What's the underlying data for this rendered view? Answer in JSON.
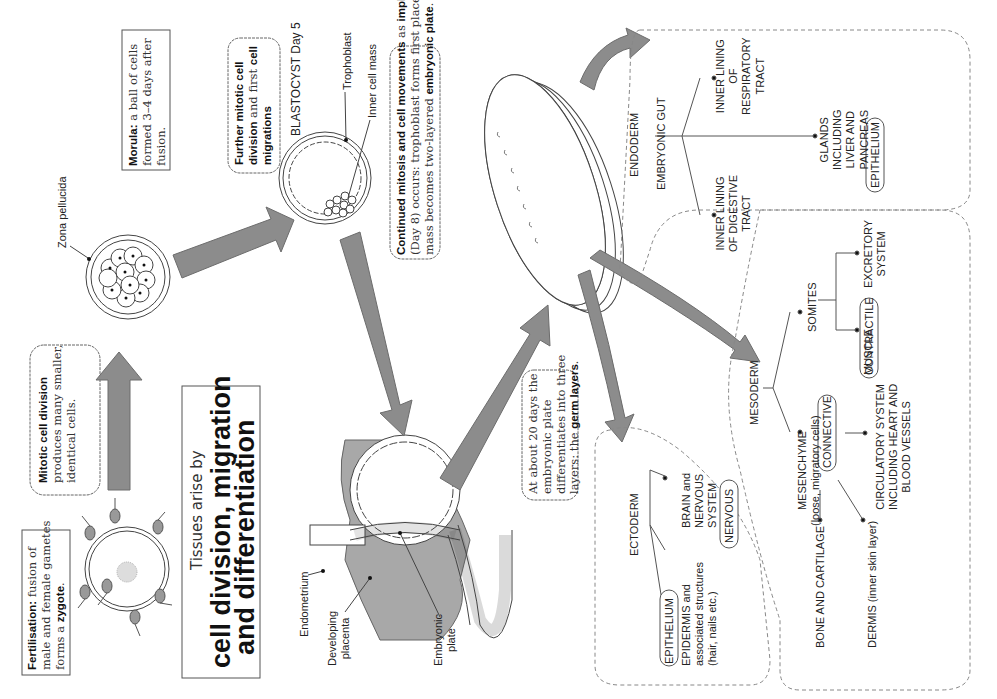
{
  "title": {
    "prefix": "Tissues arise by",
    "line1": "cell division, migration",
    "line2": "and differentiation"
  },
  "stages": {
    "fertilisation": {
      "bold": "Fertilisation:",
      "line1": " fusion of",
      "line2": "male and female gametes",
      "line3a": "forms a ",
      "line3b": "zygote",
      "line3c": "."
    },
    "mitotic": {
      "bold": "Mitotic cell division",
      "line2": "produces many smaller,",
      "line3": "identical cells."
    },
    "morula": {
      "bold": "Morula:",
      "line1": " a ball of cells",
      "line2": "formed 3–4 days after",
      "line3": "fusion.",
      "label_zona": "Zona pellucida"
    },
    "further": {
      "bold1": "Further mitotic cell",
      "bold2": "division",
      "line2": " and first ",
      "bold3": "cell",
      "bold4": "migrations"
    },
    "blastocyst": {
      "title": "BLASTOCYST Day 5",
      "trophoblast": "Trophoblast",
      "inner_cell_mass": "Inner cell mass"
    },
    "implantation": {
      "bold1": "Continued mitosis and cell movements",
      "line1": " as ",
      "bold2": "implantation",
      "line2": "(Day 8) occurs: trophoblast forms first placenta and inner cell",
      "line3a": "mass becomes two-layered ",
      "line3b": "embryonic plate",
      "line3c": "."
    },
    "implant_labels": {
      "endometrium": "Endometrium",
      "placenta1": "Developing",
      "placenta2": "placenta",
      "plate1": "Embryonic",
      "plate2": "plate"
    },
    "germ": {
      "line1": "At about 20 days the",
      "line2": "embryonic plate",
      "line3": "differentiates into three",
      "line4a": "layers: the ",
      "line4b": "germ layers",
      "line4c": "."
    }
  },
  "ectoderm": {
    "title": "ECTODERM",
    "epidermis1": "EPIDERMIS and",
    "epidermis2": "associated structures",
    "epidermis3": "(hair, nails etc.)",
    "epidermis_tissue": "EPITHELIUM",
    "brain1": "BRAIN and",
    "brain2": "NERVOUS",
    "brain3": "SYSTEM",
    "brain_tissue": "NERVOUS"
  },
  "endoderm": {
    "title": "ENDODERM",
    "gut": "EMBRYONIC GUT",
    "digestive1": "INNER LINING",
    "digestive2": "OF DIGESTIVE",
    "digestive3": "TRACT",
    "respiratory1": "INNER LINING",
    "respiratory2": "OF",
    "respiratory3": "RESPIRATORY",
    "respiratory4": "TRACT",
    "glands1": "GLANDS",
    "glands2": "INCLUDING",
    "glands3": "LIVER AND",
    "glands4": "PANCREAS",
    "glands_tissue": "EPITHELIUM"
  },
  "mesoderm": {
    "title": "MESODERM",
    "mesenchyme1": "MESENCHYME",
    "mesenchyme2": "(loose, migratory cells)",
    "mesenchyme_tissue": "CONNECTIVE",
    "somites": "SOMITES",
    "muscle": "MUSCLE",
    "muscle_tissue": "CONTRACTILE",
    "excretory1": "EXCRETORY",
    "excretory2": "SYSTEM",
    "bone": "BONE AND CARTILAGE",
    "dermis": "DERMIS (inner skin layer)",
    "circ1": "CIRCULATORY SYSTEM",
    "circ2": "INCLUDING HEART AND",
    "circ3": "BLOOD VESSELS"
  },
  "colors": {
    "arrow": "#8c8c8c",
    "placenta": "#a8a8a8",
    "line": "#444444",
    "dashed": "#888888"
  }
}
